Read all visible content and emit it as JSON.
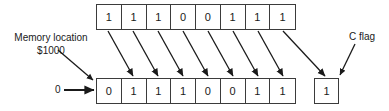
{
  "figure": {
    "background_color": "#ffffff",
    "line_color": "#3b3b3b",
    "text_color": "#1a1a1a"
  },
  "labels": {
    "memory_location_line1": "Memory location",
    "memory_location_line2": "$1000",
    "carry_flag": "C flag",
    "shift_in_value": "0"
  },
  "top_register": {
    "name": "source-byte-before-shift",
    "bits": [
      "1",
      "1",
      "1",
      "0",
      "0",
      "1",
      "1",
      "1"
    ]
  },
  "bottom_register": {
    "name": "destination-byte-after-shift",
    "bits": [
      "0",
      "1",
      "1",
      "1",
      "0",
      "0",
      "1",
      "1"
    ]
  },
  "carry_flag": {
    "name": "c-flag-box",
    "value": "1"
  },
  "arrows": {
    "bit_shift_count": 8,
    "description": "diagonal arrows from each top bit to the next bottom bit, last top bit to C flag"
  }
}
